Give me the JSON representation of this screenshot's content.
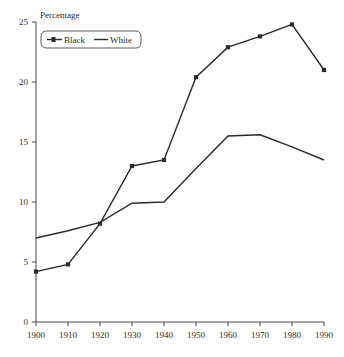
{
  "chart_data": {
    "type": "line",
    "title": "",
    "xlabel": "",
    "ylabel": "Percentage",
    "x": [
      1900,
      1910,
      1920,
      1930,
      1940,
      1950,
      1960,
      1970,
      1980,
      1990
    ],
    "categories": [
      "1900",
      "1910",
      "1920",
      "1930",
      "1940",
      "1950",
      "1960",
      "1970",
      "1980",
      "1990"
    ],
    "series": [
      {
        "name": "Black",
        "marker": "filled-square",
        "values": [
          4.2,
          4.8,
          8.2,
          13.0,
          13.5,
          20.4,
          22.9,
          23.8,
          24.8,
          21.0
        ]
      },
      {
        "name": "White",
        "marker": "none",
        "values": [
          7.0,
          7.6,
          8.3,
          9.9,
          10.0,
          12.8,
          15.5,
          15.6,
          14.6,
          13.5
        ]
      }
    ],
    "xlim": [
      1900,
      1990
    ],
    "ylim": [
      0,
      25
    ],
    "yticks": [
      0,
      5,
      10,
      15,
      20,
      25
    ],
    "ytick_labels": [
      "0",
      "5",
      "10",
      "15",
      "20",
      "25"
    ],
    "xticks": [
      1900,
      1910,
      1920,
      1930,
      1940,
      1950,
      1960,
      1970,
      1980,
      1990
    ],
    "xtick_labels": [
      "1900",
      "1910",
      "1920",
      "1930",
      "1940",
      "1950",
      "1960",
      "1970",
      "1980",
      "1990"
    ],
    "grid": false,
    "legend_position": "top-left",
    "legend_entries": [
      "Black",
      "White"
    ],
    "colors": {
      "series": "#2b2b2b",
      "axis": "#4a4a4a",
      "background": "#ffffff",
      "text": "#2b2b2b"
    }
  },
  "labels": {
    "y_axis_title": "Percentage",
    "legend_black": "Black",
    "legend_white": "White"
  }
}
